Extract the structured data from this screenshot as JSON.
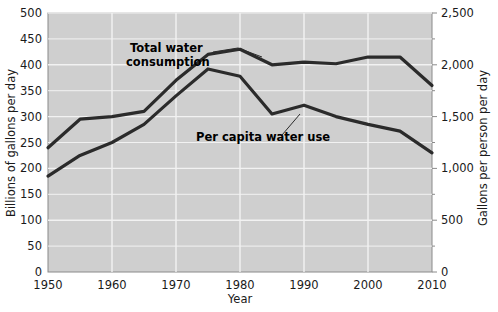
{
  "chart_data": {
    "type": "line",
    "title": "",
    "xlabel": "Year",
    "ylabel": "Billions of gallons per day",
    "ylabel_right": "Gallons per person per day",
    "x": [
      1950,
      1955,
      1960,
      1965,
      1970,
      1975,
      1980,
      1985,
      1990,
      1995,
      2000,
      2005,
      2010
    ],
    "xlim": [
      1950,
      2010
    ],
    "xticks": [
      1950,
      1960,
      1970,
      1980,
      1990,
      2000,
      2010
    ],
    "xtick_labels": [
      "1950",
      "1960",
      "1970",
      "1980",
      "1990",
      "2000",
      "2010"
    ],
    "ylim": [
      0,
      500
    ],
    "yticks": [
      0,
      50,
      100,
      150,
      200,
      250,
      300,
      350,
      400,
      450,
      500
    ],
    "ytick_labels": [
      "0",
      "50",
      "100",
      "150",
      "200",
      "250",
      "300",
      "350",
      "400",
      "450",
      "500"
    ],
    "ylim_right": [
      0,
      2500
    ],
    "yticks_right": [
      0,
      500,
      1000,
      1500,
      2000,
      2500
    ],
    "ytick_labels_right": [
      "0",
      "500",
      "1,000",
      "1,500",
      "2,000",
      "2,500"
    ],
    "grid": true,
    "legend_position": "inline-annotations",
    "plot_background": "#cfcfcf",
    "line_color": "#2b2b2b",
    "series": [
      {
        "name": "Total water consumption",
        "axis": "left",
        "units": "Billions of gallons per day",
        "values": [
          240,
          295,
          300,
          310,
          370,
          420,
          430,
          400,
          405,
          402,
          415,
          415,
          360
        ]
      },
      {
        "name": "Per capita water use",
        "axis": "right",
        "units": "Gallons per person per day",
        "values": [
          185,
          225,
          250,
          285,
          340,
          392,
          378,
          305,
          322,
          300,
          285,
          272,
          230
        ],
        "values_right_axis": [
          925,
          1125,
          1250,
          1425,
          1700,
          1960,
          1890,
          1525,
          1610,
          1500,
          1425,
          1360,
          1150
        ]
      }
    ],
    "annotations": [
      {
        "name": "Total water consumption",
        "text_line1": "Total water",
        "text_line2": "consumption"
      },
      {
        "name": "Per capita water use",
        "text_line1": "Per capita water use",
        "text_line2": ""
      }
    ]
  }
}
